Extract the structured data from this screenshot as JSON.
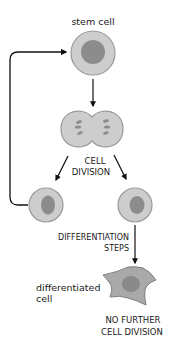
{
  "labels": {
    "stem_cell": "stem cell",
    "cell_division_line1": "CELL",
    "cell_division_line2": "DIVISION",
    "differentiation_line1": "DIFFERENTIATION",
    "differentiation_line2": "STEPS",
    "differentiated_line1": "differentiated",
    "differentiated_line2": "cell",
    "no_further_line1": "NO FURTHER",
    "no_further_line2": "CELL DIVISION"
  },
  "colors": {
    "cytoplasm": "#c9c9c9",
    "cell_outline": "#9a9a9a",
    "nucleus": "#8a8a8a",
    "differentiated_cytoplasm": "#a8a8a8",
    "arrow": "#111111"
  }
}
